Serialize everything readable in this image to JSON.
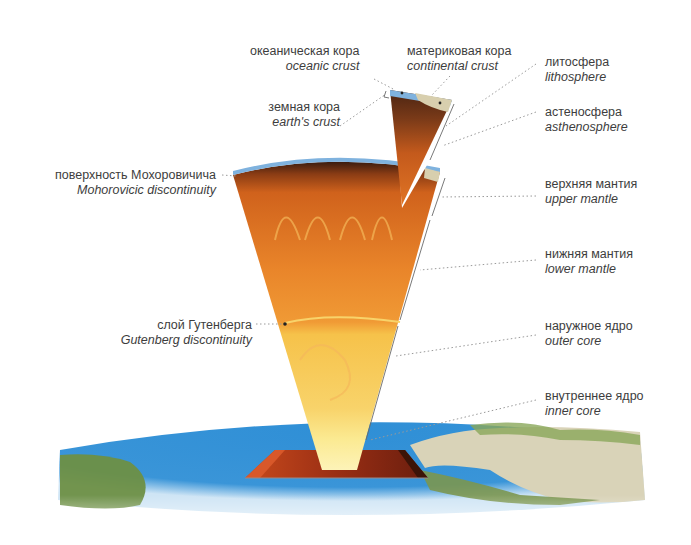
{
  "diagram": {
    "colors": {
      "ocean": "#2e8fd4",
      "crust_blue": "#7fb2de",
      "lithosphere_dark": "#5a2a14",
      "upper_mantle": "#d9661c",
      "lower_mantle": "#ee8a2a",
      "outer_core": "#f6c24a",
      "inner_core": "#fbe98a",
      "land_green": "#6d8f45",
      "land_desert": "#d9d3b8"
    },
    "labels": {
      "oceanic_crust": {
        "ru": "океаническая кора",
        "en": "oceanic crust"
      },
      "continental_crust": {
        "ru": "материковая кора",
        "en": "continental crust"
      },
      "earths_crust": {
        "ru": "земная кора",
        "en": "earth's crust"
      },
      "lithosphere": {
        "ru": "литосфера",
        "en": "lithosphere"
      },
      "asthenosphere": {
        "ru": "астеносфера",
        "en": "asthenosphere"
      },
      "moho": {
        "ru": "поверхность Мохоровичича",
        "en": "Mohorovicic discontinuity"
      },
      "upper_mantle": {
        "ru": "верхняя мантия",
        "en": "upper mantle"
      },
      "lower_mantle": {
        "ru": "нижняя мантия",
        "en": "lower mantle"
      },
      "gutenberg": {
        "ru": "слой Гутенберга",
        "en": "Gutenberg discontinuity"
      },
      "outer_core": {
        "ru": "наружное ядро",
        "en": "outer core"
      },
      "inner_core": {
        "ru": "внутреннее ядро",
        "en": "inner core"
      }
    }
  }
}
